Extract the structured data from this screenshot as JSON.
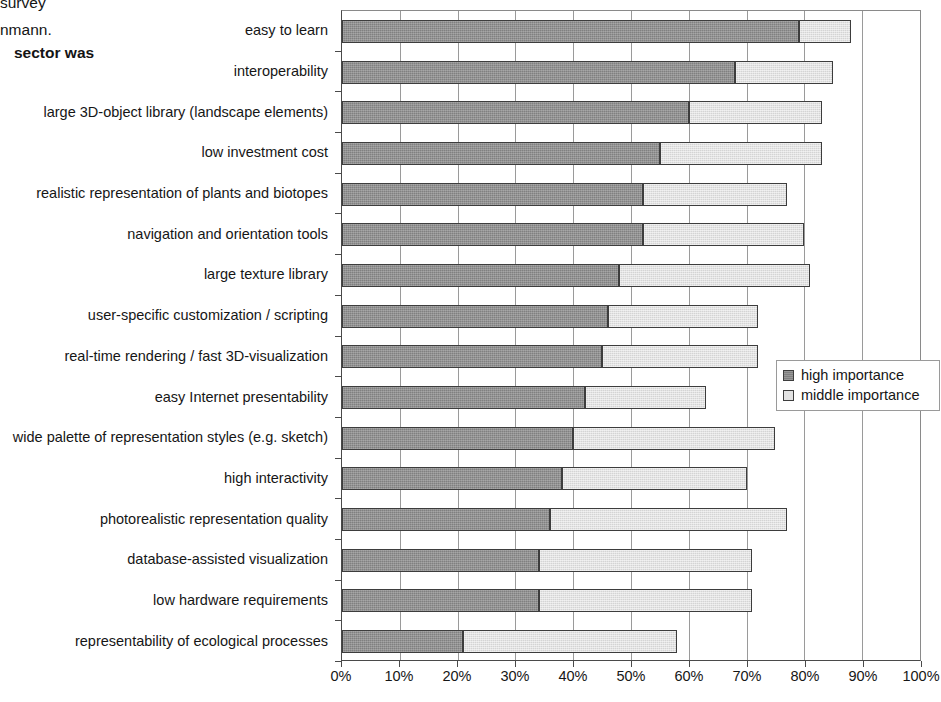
{
  "page_fragments": [
    "survey",
    "nmann.",
    "sector was"
  ],
  "legend": {
    "position": "right-middle",
    "items": [
      {
        "key": "high-importance-key",
        "label": "high importance",
        "color": "#808080"
      },
      {
        "key": "middle-importance-key",
        "label": "middle importance",
        "color": "#d4d4d4"
      }
    ]
  },
  "chart_data": {
    "type": "bar",
    "orientation": "horizontal",
    "stacked": true,
    "title": "",
    "subtitle": "",
    "xlabel": "",
    "ylabel": "",
    "xlim": [
      0,
      100
    ],
    "xtick_labels": [
      "0%",
      "10%",
      "20%",
      "30%",
      "40%",
      "50%",
      "60%",
      "70%",
      "80%",
      "90%",
      "100%"
    ],
    "xtick_values": [
      0,
      10,
      20,
      30,
      40,
      50,
      60,
      70,
      80,
      90,
      100
    ],
    "grid": true,
    "grid_axis": "x",
    "categories": [
      "easy to learn",
      "interoperability",
      "large 3D-object library (landscape elements)",
      "low investment cost",
      "realistic representation of plants and biotopes",
      "navigation and orientation tools",
      "large texture library",
      "user-specific customization / scripting",
      "real-time rendering / fast 3D-visualization",
      "easy Internet presentability",
      "wide palette of representation styles (e.g. sketch)",
      "high interactivity",
      "photorealistic representation quality",
      "database-assisted visualization",
      "low hardware requirements",
      "representability of ecological processes"
    ],
    "series": [
      {
        "name": "high importance",
        "color": "#808080",
        "values": [
          79,
          68,
          60,
          55,
          52,
          52,
          48,
          46,
          45,
          42,
          40,
          38,
          36,
          34,
          34,
          21
        ]
      },
      {
        "name": "middle importance",
        "color": "#d4d4d4",
        "values": [
          9,
          17,
          23,
          28,
          25,
          28,
          33,
          26,
          27,
          21,
          35,
          32,
          41,
          37,
          37,
          37
        ]
      }
    ],
    "cumulative_totals": [
      88,
      85,
      83,
      83,
      77,
      80,
      81,
      72,
      72,
      63,
      75,
      70,
      77,
      71,
      71,
      58
    ]
  }
}
